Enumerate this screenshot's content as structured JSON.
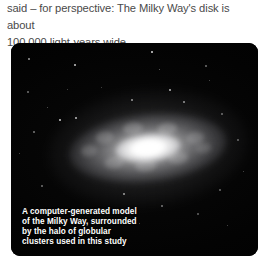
{
  "article": {
    "body_text": "said – for perspective: The Milky Way's disk is about\n100,000 light-years wide."
  },
  "figure": {
    "caption": "A computer-generated model\nof the Milky Way, surrounded\nby the halo of globular\nclusters used in this study",
    "alt_subject": "computer-generated model of the Milky Way galaxy",
    "panel_background": "#000000",
    "caption_color": "#ffffff"
  },
  "colors": {
    "page_background": "#ffffff",
    "body_text": "#4a4a4a",
    "galaxy_core": "#ffffff"
  }
}
